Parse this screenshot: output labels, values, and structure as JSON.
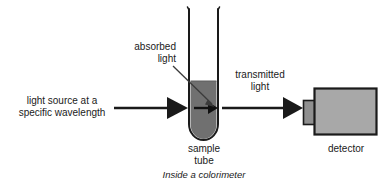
{
  "figure": {
    "caption": "Inside a colorimeter",
    "title": "Inside a colorimeter"
  },
  "labels": {
    "light_source": "light source at a\nspecific wavelength",
    "absorbed_light": "absorbed\nlight",
    "transmitted_light": "transmitted\nlight",
    "sample_tube": "sample\ntube",
    "detector": "detector"
  },
  "colors": {
    "outline": "#1a1a1a",
    "liquid_fill": "#707070",
    "detector_fill": "#a8a8a8",
    "detector_tab_fill": "#8f8f8f",
    "background": "#ffffff",
    "text": "#1a1a1a",
    "leader_line": "#3b3b3b"
  },
  "diagram": {
    "type": "schematic",
    "components": [
      {
        "name": "light-source-arrow",
        "role": "incident beam",
        "direction": "left-to-right",
        "from_x": 114,
        "to_x": 188,
        "y": 108
      },
      {
        "name": "sample-tube",
        "role": "cuvette holding sample",
        "x": 188,
        "width": 31,
        "top_y": 8,
        "bottom_y": 141,
        "liquid_top_y": 81
      },
      {
        "name": "absorbed-light-leader",
        "role": "pointer to absorption inside tube",
        "from_x": 173,
        "from_y": 67,
        "to_x": 215,
        "to_y": 107
      },
      {
        "name": "transmitted-light-arrow",
        "role": "emergent beam",
        "direction": "left-to-right",
        "from_x": 222,
        "to_x": 303,
        "y": 108
      },
      {
        "name": "detector",
        "role": "photodetector body",
        "x": 314,
        "y": 88,
        "width": 63,
        "height": 47
      },
      {
        "name": "detector-window",
        "role": "detector entrance aperture",
        "x": 303,
        "y": 100,
        "width": 12,
        "height": 24
      }
    ]
  }
}
